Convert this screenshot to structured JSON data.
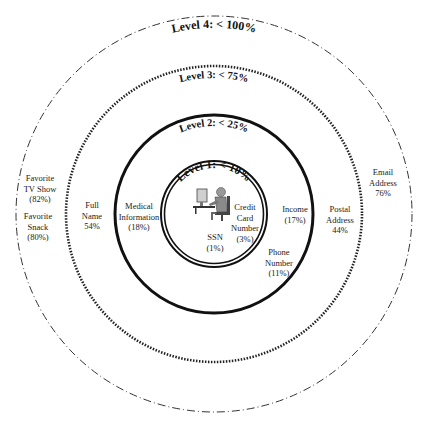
{
  "diagram": {
    "type": "concentric-circles",
    "center": [
      214,
      214
    ],
    "levels": [
      {
        "id": "level-1",
        "title": "Level 1: < 10%",
        "radius": 52,
        "stroke": "double"
      },
      {
        "id": "level-2",
        "title": "Level 2: < 25%",
        "radius": 99,
        "stroke": "solid-thick"
      },
      {
        "id": "level-3",
        "title": "Level 3: < 75%",
        "radius": 148,
        "stroke": "dotted"
      },
      {
        "id": "level-4",
        "title": "Level 4: < 100%",
        "radius": 198,
        "stroke": "dash-dot"
      }
    ],
    "center_icon": "person-at-computer-icon",
    "items": [
      {
        "id": "ssn",
        "lines": [
          "SSN",
          "(1%)"
        ],
        "level": 1
      },
      {
        "id": "credit-card",
        "lines": [
          "Credit",
          "Card",
          "Number",
          "(3%)"
        ],
        "level": 1
      },
      {
        "id": "phone-number",
        "lines": [
          "Phone",
          "Number",
          "(11%)"
        ],
        "level": 2
      },
      {
        "id": "income",
        "lines": [
          "Income",
          "(17%)"
        ],
        "level": 2
      },
      {
        "id": "medical",
        "lines": [
          "Medical",
          "Information",
          "(18%)"
        ],
        "level": 2
      },
      {
        "id": "postal-address",
        "lines": [
          "Postal",
          "Address",
          "44%"
        ],
        "level": 3
      },
      {
        "id": "full-name",
        "lines": [
          "Full",
          "Name",
          "54%"
        ],
        "level": 3
      },
      {
        "id": "email-address",
        "lines": [
          "Email",
          "Address",
          "76%"
        ],
        "level": 4
      },
      {
        "id": "favorite-snack",
        "lines": [
          "Favorite",
          "Snack",
          "(80%)"
        ],
        "level": 4
      },
      {
        "id": "favorite-tv-show",
        "lines": [
          "Favorite",
          "TV Show",
          "(82%)"
        ],
        "level": 4
      }
    ]
  }
}
